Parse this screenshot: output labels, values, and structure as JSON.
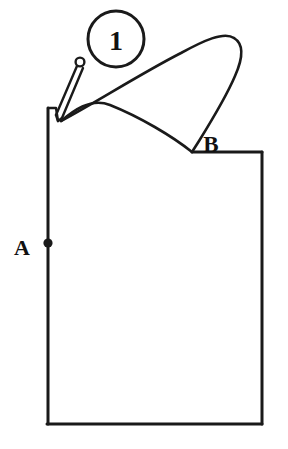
{
  "figure": {
    "background_color": "#ffffff",
    "line_color": "#1a1a1a",
    "line_width": 3,
    "canvas": {
      "width": 288,
      "height": 449
    }
  },
  "callout": {
    "number": "1",
    "shape": "circle",
    "center_x": 116,
    "center_y": 39,
    "radius": 28,
    "stroke_width": 3
  },
  "labels": [
    {
      "id": "label-a",
      "text": "A",
      "x": 22,
      "y": 255,
      "font_size": 22,
      "description": "Point A label beside marker dot on left vertical edge"
    },
    {
      "id": "label-b",
      "text": "B",
      "x": 203,
      "y": 152,
      "font_size": 22,
      "description": "Point B label at notch vertex on upper right"
    }
  ],
  "markers": [
    {
      "id": "point-a-dot",
      "shape": "filled-circle",
      "cx": 48,
      "cy": 243,
      "r": 4.5
    }
  ],
  "pin": {
    "description": "Straight pin with round head at upper right tapering to a point at lower left",
    "head_cx": 80,
    "head_cy": 62,
    "head_r": 4.2,
    "tip_x": 58,
    "tip_y": 120
  },
  "outline": {
    "description": "Closed panel outline: left vertical edge, bottom edge, right vertical edge, short horizontal top edge ending at notch vertex B",
    "left_edge": {
      "x": 48,
      "y_top": 108,
      "y_bottom": 424
    },
    "bottom_edge": {
      "y": 424,
      "x_left": 48,
      "x_right": 262
    },
    "right_edge": {
      "x": 262,
      "y_top": 152,
      "y_bottom": 424
    },
    "top_right_edge": {
      "y": 152,
      "x_left": 192,
      "x_right": 262
    },
    "notch_vertex": {
      "x": 192,
      "y": 152
    }
  },
  "curve": {
    "description": "Long arcing loop from pin tip up over the panel and back down to the notch vertex at B",
    "apex": {
      "x": 235,
      "y": 38
    },
    "start": {
      "x": 62,
      "y": 122
    },
    "end": {
      "x": 192,
      "y": 152
    }
  },
  "caption": {
    "text": "",
    "visible": false
  }
}
